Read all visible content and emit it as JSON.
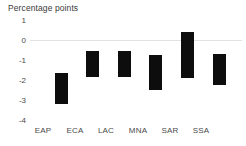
{
  "chart_data": {
    "type": "bar",
    "title": "Percentage points",
    "subtitle": "",
    "xlabel": "",
    "ylabel": "Percentage points",
    "categories": [
      "EAP",
      "ECA",
      "LAC",
      "MNA",
      "SAR",
      "SSA"
    ],
    "bars": [
      {
        "category": "EAP",
        "low": -3.2,
        "high": -1.65
      },
      {
        "category": "ECA",
        "low": -1.85,
        "high": -0.55
      },
      {
        "category": "LAC",
        "low": -1.85,
        "high": -0.55
      },
      {
        "category": "MNA",
        "low": -2.5,
        "high": -0.75
      },
      {
        "category": "SAR",
        "low": -1.9,
        "high": 0.4
      },
      {
        "category": "SSA",
        "low": -2.25,
        "high": -0.7
      }
    ],
    "values": [
      -3.2,
      -1.85,
      -1.85,
      -2.5,
      -1.9,
      -2.25
    ],
    "ylim": [
      -4,
      1
    ],
    "yticks": [
      1,
      0,
      -1,
      -2,
      -3,
      -4
    ],
    "ytick_labels": [
      "1",
      "0",
      "-1",
      "-2",
      "-3",
      "-4"
    ],
    "grid": false,
    "legend": null,
    "legend_position": "none",
    "zero_line": true,
    "bar_color": "#0d0d0d",
    "zero_line_color": "#e2e2e2",
    "axis_text_color": "#4a4a4a",
    "title_color": "#3a3a3a"
  }
}
